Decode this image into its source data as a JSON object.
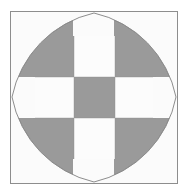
{
  "figure": {
    "canvas": {
      "width": 190,
      "height": 196,
      "background": "#ffffff"
    },
    "frame": {
      "name": "outer-border",
      "x": 10,
      "y": 11,
      "width": 168,
      "height": 173,
      "stroke": "#8d8d8d",
      "stroke_width": 1,
      "fill": "#fbfbfb"
    },
    "palette": {
      "gray_fill": "#9a9a9a",
      "white_fill": "#fcfcfc",
      "outline": "#8d8d8d",
      "grid_line": "#8d8d8d",
      "page_background": "#ffffff",
      "plate_background": "#fbfbfb"
    },
    "shape": {
      "name": "astroid",
      "description": "Four-pointed concave star; concave arcs bulge inward from each corner, cusps touch the midpoint of each frame side.",
      "cusp_count": 4,
      "fill": "#9a9a9a",
      "stroke": "#8d8d8d",
      "cusps": [
        {
          "label": "top",
          "x": 84,
          "y": 0
        },
        {
          "label": "right",
          "x": 168,
          "y": 86
        },
        {
          "label": "bottom",
          "x": 84,
          "y": 173
        },
        {
          "label": "left",
          "x": 0,
          "y": 86
        }
      ],
      "corner_arc_radius": 112
    },
    "checkerboard": {
      "name": "center-checkerboard",
      "rows": 3,
      "columns": 3,
      "cell_width": 40,
      "cell_height": 41,
      "origin_x": 64,
      "origin_y": 66,
      "pattern": [
        [
          "gray",
          "white",
          "gray"
        ],
        [
          "white",
          "gray",
          "white"
        ],
        [
          "gray",
          "white",
          "gray"
        ]
      ],
      "cells": [
        {
          "row": 0,
          "col": 0,
          "fill": "gray"
        },
        {
          "row": 0,
          "col": 1,
          "fill": "white"
        },
        {
          "row": 0,
          "col": 2,
          "fill": "gray"
        },
        {
          "row": 1,
          "col": 0,
          "fill": "white"
        },
        {
          "row": 1,
          "col": 1,
          "fill": "gray"
        },
        {
          "row": 1,
          "col": 2,
          "fill": "white"
        },
        {
          "row": 2,
          "col": 0,
          "fill": "gray"
        },
        {
          "row": 2,
          "col": 1,
          "fill": "white"
        },
        {
          "row": 2,
          "col": 2,
          "fill": "gray"
        }
      ]
    },
    "arms": {
      "description": "White cross bands extend from the middle checkerboard row and column out to the astroid cusps.",
      "band_thickness": 41,
      "fill": "#fcfcfc"
    }
  }
}
